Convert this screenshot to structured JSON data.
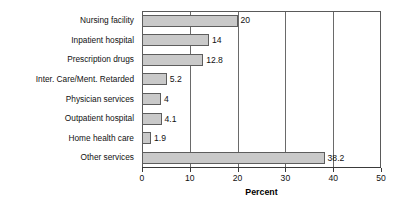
{
  "chart_data": {
    "type": "bar",
    "orientation": "horizontal",
    "title": "",
    "xlabel": "Percent",
    "ylabel": "",
    "categories": [
      "Nursing facility",
      "Inpatient hospital",
      "Prescription drugs",
      "Inter. Care/Ment. Retarded",
      "Physician services",
      "Outpatient hospital",
      "Home health care",
      "Other services"
    ],
    "values": [
      20,
      14,
      12.8,
      5.2,
      4,
      4.1,
      1.9,
      38.2
    ],
    "value_labels": [
      "20",
      "14",
      "12.8",
      "5.2",
      "4",
      "4.1",
      "1.9",
      "38.2"
    ],
    "xlim": [
      0,
      50
    ],
    "xticks": [
      0,
      10,
      20,
      30,
      40,
      50
    ],
    "xtick_labels": [
      "0",
      "10",
      "20",
      "30",
      "40",
      "50"
    ],
    "gridlines_x": [
      10,
      20,
      30,
      40
    ],
    "grid": true,
    "legend": false,
    "bar_color": "#c9c9c9",
    "bar_border_color": "#5d5d5d",
    "frame_color": "#5a5a5a",
    "background": "#ffffff"
  }
}
